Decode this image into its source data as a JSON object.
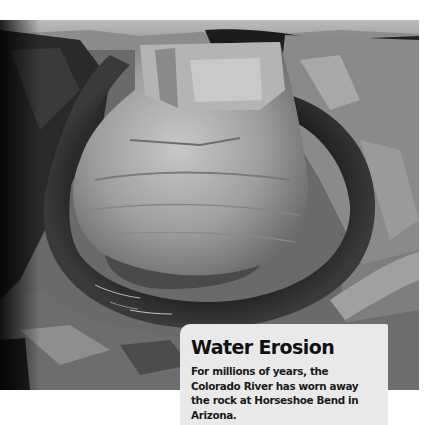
{
  "photo": {
    "subject": "Horseshoe Bend canyon with river",
    "alt": "Black-and-white aerial photo of the Colorado River curving around Horseshoe Bend"
  },
  "caption": {
    "title": "Water Erosion",
    "body": "For millions of years, the Colorado River has worn away the rock at Horseshoe Bend in Arizona."
  },
  "colors": {
    "caption_background": "#e9e9e9",
    "caption_text": "#111111"
  }
}
